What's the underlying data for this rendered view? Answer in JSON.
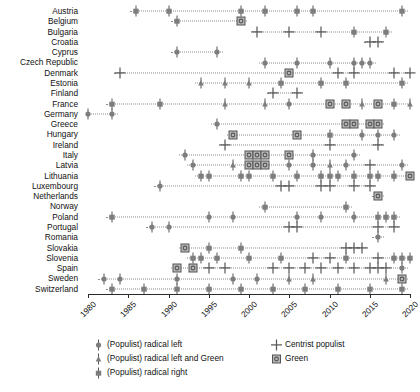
{
  "chart_data": {
    "type": "scatter",
    "title": "",
    "xlabel": "",
    "ylabel": "",
    "xlim": [
      1980,
      2020
    ],
    "xticks": [
      1980,
      1985,
      1990,
      1995,
      2000,
      2005,
      2010,
      2015,
      2020
    ],
    "xtick_labels": [
      "1980",
      "1985",
      "1990",
      "1995",
      "2000",
      "2005",
      "2010",
      "2015",
      "2020"
    ],
    "grid": false,
    "legend_position": "below-plot",
    "marker_colors": {
      "grey": "#7d7d7d",
      "dark": "#555555",
      "black": "#000000",
      "green_fill": "#b7b7b7",
      "line": "#8d8d8d"
    },
    "marker_types": {
      "radical_left": "circle-with-stem",
      "radical_left_and_green": "triangle-with-stem",
      "radical_right": "square-with-stem",
      "centrist_populist": "plus",
      "green": "square-with-inner-circle"
    },
    "categories": [
      "Austria",
      "Belgium",
      "Bulgaria",
      "Croatia",
      "Cyprus",
      "Czech Republic",
      "Denmark",
      "Estonia",
      "Finland",
      "France",
      "Germany",
      "Greece",
      "Hungary",
      "Ireland",
      "Italy",
      "Latvia",
      "Lithuania",
      "Luxembourg",
      "Netherlands",
      "Norway",
      "Poland",
      "Portugal",
      "Romania",
      "Slovakia",
      "Slovenia",
      "Spain",
      "Sweden",
      "Switzerland"
    ],
    "series": [
      {
        "name": "Austria",
        "points": [
          {
            "x": 1986,
            "type": "radical_right"
          },
          {
            "x": 1990,
            "type": "radical_right"
          },
          {
            "x": 1999,
            "type": "radical_right"
          },
          {
            "x": 2002,
            "type": "radical_right"
          },
          {
            "x": 2006,
            "type": "radical_right"
          },
          {
            "x": 2008,
            "type": "radical_right"
          },
          {
            "x": 2019,
            "type": "radical_right"
          }
        ]
      },
      {
        "name": "Belgium",
        "points": [
          {
            "x": 1991,
            "type": "radical_right"
          },
          {
            "x": 1999,
            "type": "green"
          }
        ]
      },
      {
        "name": "Bulgaria",
        "points": [
          {
            "x": 2001,
            "type": "centrist_populist"
          },
          {
            "x": 2005,
            "type": "centrist_populist"
          },
          {
            "x": 2009,
            "type": "centrist_populist"
          },
          {
            "x": 2013,
            "type": "radical_right"
          },
          {
            "x": 2017,
            "type": "radical_right"
          }
        ]
      },
      {
        "name": "Croatia",
        "points": [
          {
            "x": 2015,
            "type": "centrist_populist"
          },
          {
            "x": 2016,
            "type": "centrist_populist"
          }
        ]
      },
      {
        "name": "Cyprus",
        "points": [
          {
            "x": 1991,
            "type": "radical_left"
          },
          {
            "x": 1996,
            "type": "radical_left"
          }
        ]
      },
      {
        "name": "Czech Republic",
        "points": [
          {
            "x": 2002,
            "type": "radical_left"
          },
          {
            "x": 2006,
            "type": "radical_left"
          },
          {
            "x": 2010,
            "type": "radical_left"
          },
          {
            "x": 2013,
            "type": "radical_left"
          },
          {
            "x": 2014,
            "type": "radical_left"
          },
          {
            "x": 2015,
            "type": "radical_left"
          }
        ]
      },
      {
        "name": "Denmark",
        "points": [
          {
            "x": 1984,
            "type": "centrist_populist"
          },
          {
            "x": 2005,
            "type": "green"
          },
          {
            "x": 2011,
            "type": "centrist_populist"
          },
          {
            "x": 2013,
            "type": "centrist_populist"
          },
          {
            "x": 2018,
            "type": "centrist_populist"
          },
          {
            "x": 2020,
            "type": "centrist_populist"
          }
        ]
      },
      {
        "name": "Estonia",
        "points": [
          {
            "x": 1994,
            "type": "radical_left_and_green"
          },
          {
            "x": 1997,
            "type": "radical_left_and_green"
          },
          {
            "x": 2000,
            "type": "radical_left_and_green"
          },
          {
            "x": 2004,
            "type": "radical_right"
          },
          {
            "x": 2009,
            "type": "radical_right"
          },
          {
            "x": 2012,
            "type": "radical_right"
          },
          {
            "x": 2019,
            "type": "radical_right"
          }
        ]
      },
      {
        "name": "Finland",
        "points": [
          {
            "x": 2003,
            "type": "centrist_populist"
          },
          {
            "x": 2006,
            "type": "centrist_populist"
          }
        ]
      },
      {
        "name": "France",
        "points": [
          {
            "x": 1983,
            "type": "radical_right"
          },
          {
            "x": 1989,
            "type": "radical_right"
          },
          {
            "x": 1997,
            "type": "radical_left_and_green"
          },
          {
            "x": 2002,
            "type": "radical_left_and_green"
          },
          {
            "x": 2005,
            "type": "radical_left"
          },
          {
            "x": 2010,
            "type": "green"
          },
          {
            "x": 2012,
            "type": "green"
          },
          {
            "x": 2014,
            "type": "radical_left_and_green"
          },
          {
            "x": 2016,
            "type": "green"
          },
          {
            "x": 2018,
            "type": "radical_right"
          },
          {
            "x": 2020,
            "type": "radical_left_and_green"
          }
        ]
      },
      {
        "name": "Germany",
        "points": [
          {
            "x": 1980,
            "type": "radical_left"
          },
          {
            "x": 1983,
            "type": "radical_left"
          }
        ]
      },
      {
        "name": "Greece",
        "points": [
          {
            "x": 1996,
            "type": "radical_left"
          },
          {
            "x": 2012,
            "type": "green"
          },
          {
            "x": 2013,
            "type": "green"
          },
          {
            "x": 2015,
            "type": "green"
          },
          {
            "x": 2016,
            "type": "green"
          }
        ]
      },
      {
        "name": "Hungary",
        "points": [
          {
            "x": 1998,
            "type": "green"
          },
          {
            "x": 2006,
            "type": "green"
          },
          {
            "x": 2010,
            "type": "radical_right"
          },
          {
            "x": 2014,
            "type": "radical_left"
          },
          {
            "x": 2016,
            "type": "radical_left"
          },
          {
            "x": 2018,
            "type": "radical_left"
          }
        ]
      },
      {
        "name": "Ireland",
        "points": [
          {
            "x": 1997,
            "type": "centrist_populist"
          },
          {
            "x": 2010,
            "type": "centrist_populist"
          },
          {
            "x": 2016,
            "type": "centrist_populist"
          }
        ]
      },
      {
        "name": "Italy",
        "points": [
          {
            "x": 1992,
            "type": "radical_left"
          },
          {
            "x": 2000,
            "type": "green"
          },
          {
            "x": 2001,
            "type": "green"
          },
          {
            "x": 2002,
            "type": "green"
          },
          {
            "x": 2005,
            "type": "green"
          },
          {
            "x": 2008,
            "type": "radical_left"
          },
          {
            "x": 2013,
            "type": "radical_left"
          }
        ]
      },
      {
        "name": "Latvia",
        "points": [
          {
            "x": 1993,
            "type": "radical_left"
          },
          {
            "x": 1998,
            "type": "radical_left_and_green"
          },
          {
            "x": 2000,
            "type": "green"
          },
          {
            "x": 2001,
            "type": "green"
          },
          {
            "x": 2002,
            "type": "green"
          },
          {
            "x": 2005,
            "type": "radical_left"
          },
          {
            "x": 2008,
            "type": "radical_left"
          },
          {
            "x": 2010,
            "type": "radical_left_and_green"
          },
          {
            "x": 2012,
            "type": "radical_left"
          },
          {
            "x": 2015,
            "type": "centrist_populist"
          },
          {
            "x": 2019,
            "type": "radical_left"
          }
        ]
      },
      {
        "name": "Lithuania",
        "points": [
          {
            "x": 1994,
            "type": "radical_right"
          },
          {
            "x": 1995,
            "type": "radical_right"
          },
          {
            "x": 1999,
            "type": "radical_right"
          },
          {
            "x": 2000,
            "type": "radical_right"
          },
          {
            "x": 2003,
            "type": "radical_right"
          },
          {
            "x": 2006,
            "type": "radical_right"
          },
          {
            "x": 2009,
            "type": "radical_right"
          },
          {
            "x": 2010,
            "type": "radical_right"
          },
          {
            "x": 2011,
            "type": "radical_right"
          },
          {
            "x": 2013,
            "type": "radical_right"
          },
          {
            "x": 2015,
            "type": "radical_right"
          },
          {
            "x": 2016,
            "type": "radical_right"
          },
          {
            "x": 2018,
            "type": "radical_right"
          },
          {
            "x": 2020,
            "type": "green"
          }
        ]
      },
      {
        "name": "Luxembourg",
        "points": [
          {
            "x": 1989,
            "type": "radical_left"
          },
          {
            "x": 2004,
            "type": "centrist_populist"
          },
          {
            "x": 2005,
            "type": "centrist_populist"
          },
          {
            "x": 2009,
            "type": "centrist_populist"
          },
          {
            "x": 2010,
            "type": "centrist_populist"
          },
          {
            "x": 2013,
            "type": "centrist_populist"
          },
          {
            "x": 2015,
            "type": "centrist_populist"
          }
        ]
      },
      {
        "name": "Netherlands",
        "points": [
          {
            "x": 2016,
            "type": "green"
          }
        ]
      },
      {
        "name": "Norway",
        "points": [
          {
            "x": 2002,
            "type": "radical_right"
          },
          {
            "x": 2012,
            "type": "radical_right"
          }
        ]
      },
      {
        "name": "Poland",
        "points": [
          {
            "x": 1983,
            "type": "radical_right"
          },
          {
            "x": 1995,
            "type": "radical_left"
          },
          {
            "x": 1998,
            "type": "radical_left"
          },
          {
            "x": 2006,
            "type": "radical_left"
          },
          {
            "x": 2009,
            "type": "radical_left"
          },
          {
            "x": 2013,
            "type": "radical_left"
          },
          {
            "x": 2016,
            "type": "radical_right"
          },
          {
            "x": 2017,
            "type": "radical_right"
          },
          {
            "x": 2018,
            "type": "radical_right"
          }
        ]
      },
      {
        "name": "Portugal",
        "points": [
          {
            "x": 1988,
            "type": "radical_left"
          },
          {
            "x": 1990,
            "type": "radical_left"
          },
          {
            "x": 2005,
            "type": "centrist_populist"
          },
          {
            "x": 2006,
            "type": "centrist_populist"
          },
          {
            "x": 2016,
            "type": "centrist_populist"
          },
          {
            "x": 2018,
            "type": "centrist_populist"
          }
        ]
      },
      {
        "name": "Romania",
        "points": [
          {
            "x": 2016,
            "type": "radical_left"
          }
        ]
      },
      {
        "name": "Slovakia",
        "points": [
          {
            "x": 1992,
            "type": "green"
          },
          {
            "x": 1995,
            "type": "radical_right"
          },
          {
            "x": 1999,
            "type": "radical_right"
          },
          {
            "x": 2012,
            "type": "centrist_populist"
          },
          {
            "x": 2013,
            "type": "centrist_populist"
          },
          {
            "x": 2014,
            "type": "centrist_populist"
          }
        ]
      },
      {
        "name": "Slovenia",
        "points": [
          {
            "x": 1993,
            "type": "radical_right"
          },
          {
            "x": 1994,
            "type": "radical_right"
          },
          {
            "x": 1996,
            "type": "radical_right"
          },
          {
            "x": 2000,
            "type": "radical_right"
          },
          {
            "x": 2004,
            "type": "radical_right"
          },
          {
            "x": 2008,
            "type": "centrist_populist"
          },
          {
            "x": 2010,
            "type": "centrist_populist"
          },
          {
            "x": 2012,
            "type": "radical_right"
          },
          {
            "x": 2016,
            "type": "centrist_populist"
          },
          {
            "x": 2018,
            "type": "radical_right"
          },
          {
            "x": 2019,
            "type": "radical_right"
          },
          {
            "x": 2020,
            "type": "radical_right"
          }
        ]
      },
      {
        "name": "Spain",
        "points": [
          {
            "x": 1991,
            "type": "green"
          },
          {
            "x": 1993,
            "type": "green"
          },
          {
            "x": 1995,
            "type": "centrist_populist"
          },
          {
            "x": 1997,
            "type": "centrist_populist"
          },
          {
            "x": 2003,
            "type": "centrist_populist"
          },
          {
            "x": 2005,
            "type": "centrist_populist"
          },
          {
            "x": 2007,
            "type": "centrist_populist"
          },
          {
            "x": 2009,
            "type": "centrist_populist"
          },
          {
            "x": 2011,
            "type": "centrist_populist"
          },
          {
            "x": 2013,
            "type": "centrist_populist"
          },
          {
            "x": 2015,
            "type": "centrist_populist"
          },
          {
            "x": 2016,
            "type": "centrist_populist"
          },
          {
            "x": 2017,
            "type": "centrist_populist"
          },
          {
            "x": 2019,
            "type": "radical_left"
          }
        ]
      },
      {
        "name": "Sweden",
        "points": [
          {
            "x": 1982,
            "type": "radical_left"
          },
          {
            "x": 1984,
            "type": "radical_left"
          },
          {
            "x": 1991,
            "type": "radical_left"
          },
          {
            "x": 1998,
            "type": "radical_left"
          },
          {
            "x": 2001,
            "type": "radical_left"
          },
          {
            "x": 2005,
            "type": "radical_left_and_green"
          },
          {
            "x": 2008,
            "type": "radical_left_and_green"
          },
          {
            "x": 2017,
            "type": "radical_left_and_green"
          },
          {
            "x": 2019,
            "type": "green"
          }
        ]
      },
      {
        "name": "Switzerland",
        "points": [
          {
            "x": 1983,
            "type": "radical_right"
          },
          {
            "x": 1987,
            "type": "radical_right"
          },
          {
            "x": 1991,
            "type": "radical_right"
          },
          {
            "x": 1995,
            "type": "radical_right"
          },
          {
            "x": 1999,
            "type": "radical_right"
          },
          {
            "x": 2003,
            "type": "radical_right"
          },
          {
            "x": 2007,
            "type": "radical_right"
          },
          {
            "x": 2011,
            "type": "radical_right"
          },
          {
            "x": 2015,
            "type": "radical_right"
          },
          {
            "x": 2019,
            "type": "radical_right"
          }
        ]
      }
    ],
    "legend": [
      {
        "label": "(Populist) radical left",
        "marker": "radical_left",
        "column": 0
      },
      {
        "label": "(Populist) radical left and Green",
        "marker": "radical_left_and_green",
        "column": 0
      },
      {
        "label": "(Populist) radical right",
        "marker": "radical_right",
        "column": 0
      },
      {
        "label": "Centrist populist",
        "marker": "centrist_populist",
        "column": 1
      },
      {
        "label": "Green",
        "marker": "green",
        "column": 1
      }
    ]
  }
}
